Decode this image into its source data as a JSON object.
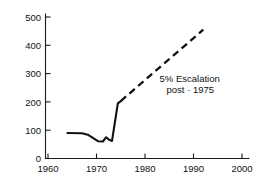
{
  "chart_data": {
    "type": "line",
    "title": "",
    "xlabel": "",
    "ylabel": "",
    "xlim": [
      1960,
      2000
    ],
    "ylim": [
      0,
      500
    ],
    "grid": false,
    "legend": "none",
    "xticks": [
      1960,
      1970,
      1980,
      1990,
      2000
    ],
    "xtick_labels": [
      "1960",
      "1970",
      "1980",
      "1990",
      "2000"
    ],
    "yticks": [
      0,
      100,
      200,
      300,
      400,
      500
    ],
    "ytick_labels": [
      "0",
      "100",
      "200",
      "300",
      "400",
      "500"
    ],
    "series": [
      {
        "name": "historical",
        "style": "solid",
        "x": [
          1964.0,
          1967.0,
          1968.2,
          1970.3,
          1971.3,
          1972.0,
          1972.6,
          1973.2,
          1974.4,
          1975.0
        ],
        "values": [
          90,
          89,
          84,
          61,
          60,
          75,
          66,
          62,
          195,
          203
        ]
      },
      {
        "name": "projection",
        "style": "dashed",
        "x": [
          1975.0,
          1992.0
        ],
        "values": [
          203,
          455
        ]
      }
    ],
    "annotations": [
      {
        "name": "escalation-note",
        "line1": "5% Escalation",
        "line2": "post · 1975",
        "x": 1983.0,
        "y": 270
      }
    ]
  }
}
